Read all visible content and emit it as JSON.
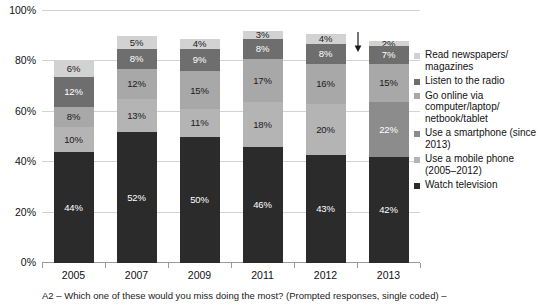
{
  "chart_data": {
    "type": "bar",
    "subtype": "stacked-bar-percent",
    "title": "",
    "xlabel": "",
    "ylabel": "",
    "ylim": [
      0,
      100
    ],
    "yticks": [
      "0%",
      "20%",
      "40%",
      "60%",
      "80%",
      "100%"
    ],
    "ytick_values": [
      0,
      20,
      40,
      60,
      80,
      100
    ],
    "grid": true,
    "legend_position": "right",
    "categories": [
      "2005",
      "2007",
      "2009",
      "2011",
      "2012",
      "2013"
    ],
    "series": [
      {
        "name": "Watch television",
        "color": "#2b2b2b",
        "label_color": "#ffffff",
        "values": [
          44,
          52,
          50,
          46,
          43,
          42
        ],
        "labels": [
          "44%",
          "52%",
          "50%",
          "46%",
          "43%",
          "42%"
        ]
      },
      {
        "name": "Use a mobile phone (2005–2012)",
        "color": "#b4b4b4",
        "label_color": "#1a1a1a",
        "values": [
          10,
          13,
          11,
          18,
          20,
          0
        ],
        "labels": [
          "10%",
          "13%",
          "11%",
          "18%",
          "20%",
          ""
        ]
      },
      {
        "name": "Use a smartphone (since 2013)",
        "color": "#8c8c8c",
        "label_color": "#ffffff",
        "values": [
          0,
          0,
          0,
          0,
          0,
          22
        ],
        "labels": [
          "",
          "",
          "",
          "",
          "",
          "22%"
        ]
      },
      {
        "name": "Go online via computer/laptop/netbook/tablet",
        "color": "#a8a8a8",
        "label_color": "#1a1a1a",
        "values": [
          8,
          12,
          15,
          17,
          16,
          15
        ],
        "labels": [
          "8%",
          "12%",
          "15%",
          "17%",
          "16%",
          "15%"
        ]
      },
      {
        "name": "Listen to the radio",
        "color": "#6e6e6e",
        "label_color": "#ffffff",
        "values": [
          12,
          8,
          9,
          8,
          8,
          7
        ],
        "labels": [
          "12%",
          "8%",
          "9%",
          "8%",
          "8%",
          "7%"
        ]
      },
      {
        "name": "Read newspapers/magazines",
        "color": "#d2d2d2",
        "label_color": "#1a1a1a",
        "values": [
          6,
          5,
          4,
          3,
          4,
          2
        ],
        "labels": [
          "6%",
          "5%",
          "4%",
          "3%",
          "4%",
          "2%"
        ]
      }
    ],
    "totals": [
      80,
      90,
      89,
      92,
      91,
      88
    ],
    "annotations": [
      {
        "name": "decline-arrow",
        "glyph": "↓",
        "near_category": "2013"
      }
    ]
  },
  "legend": {
    "items": [
      {
        "label": "Read newspapers/ magazines",
        "color": "#d2d2d2"
      },
      {
        "label": "Listen to the radio",
        "color": "#6e6e6e"
      },
      {
        "label": "Go online via computer/laptop/ netbook/tablet",
        "color": "#a8a8a8"
      },
      {
        "label": "Use a smartphone (since 2013)",
        "color": "#8c8c8c"
      },
      {
        "label": "Use a mobile phone (2005–2012)",
        "color": "#b4b4b4"
      },
      {
        "label": "Watch television",
        "color": "#2b2b2b"
      }
    ]
  },
  "footnote": {
    "text": "A2 – Which one of these would you miss doing the most? (Prompted responses, single coded) –"
  }
}
